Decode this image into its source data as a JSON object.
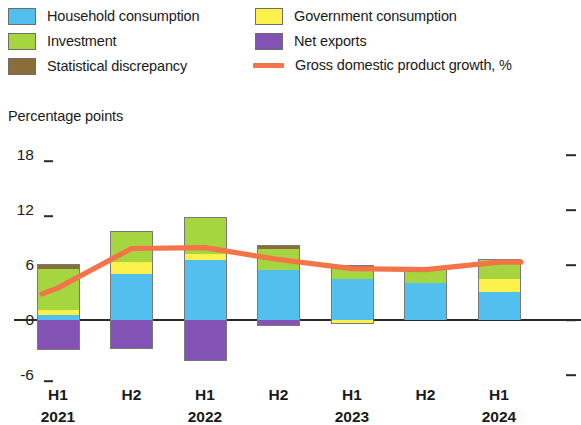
{
  "legend": {
    "items": [
      {
        "label": "Household consumption",
        "color": "#52c0ef",
        "kind": "swatch",
        "icon": "legend-swatch-household-consumption"
      },
      {
        "label": "Investment",
        "color": "#a6d63f",
        "kind": "swatch",
        "icon": "legend-swatch-investment"
      },
      {
        "label": "Statistical discrepancy",
        "color": "#8a6d3b",
        "kind": "swatch",
        "icon": "legend-swatch-statistical-discrepancy"
      },
      {
        "label": "Government consumption",
        "color": "#fbf14a",
        "kind": "swatch",
        "icon": "legend-swatch-government-consumption"
      },
      {
        "label": "Net exports",
        "color": "#8253b5",
        "kind": "swatch",
        "icon": "legend-swatch-net-exports"
      },
      {
        "label": "Gross domestic product growth, %",
        "color": "#f4744a",
        "kind": "line",
        "icon": "legend-line-gdp-growth"
      }
    ]
  },
  "axis": {
    "y_title": "Percentage points",
    "y_ticks": [
      "18",
      "12",
      "6",
      "0",
      "-6"
    ],
    "x_periods": [
      "H1",
      "H2",
      "H1",
      "H2",
      "H1",
      "H2",
      "H1"
    ],
    "x_years": [
      "2021",
      "2022",
      "2023",
      "2024"
    ]
  },
  "chart_data": {
    "type": "bar",
    "subtype": "stacked-bar-with-line-overlay",
    "title": "",
    "xlabel": "",
    "ylabel": "Percentage points",
    "ylim": [
      -8,
      18
    ],
    "yticks": [
      -6,
      0,
      6,
      12,
      18
    ],
    "grid": false,
    "legend_position": "top",
    "stacked": true,
    "categories": [
      "H1 2021",
      "H2 2021",
      "H1 2022",
      "H2 2022",
      "H1 2023",
      "H2 2023",
      "H1 2024"
    ],
    "series": [
      {
        "name": "Household consumption",
        "color": "#52c0ef",
        "values": [
          0.5,
          5.0,
          6.5,
          5.5,
          4.5,
          4.0,
          3.0
        ]
      },
      {
        "name": "Investment",
        "color": "#a6d63f",
        "values": [
          4.5,
          3.4,
          4.0,
          2.2,
          1.3,
          1.6,
          2.0
        ]
      },
      {
        "name": "Government consumption",
        "color": "#fbf14a",
        "values": [
          0.6,
          1.3,
          0.7,
          0.0,
          -0.4,
          0.0,
          1.5
        ]
      },
      {
        "name": "Net exports",
        "color": "#8253b5",
        "values": [
          -3.3,
          -3.0,
          -4.5,
          -0.6,
          0.0,
          0.0,
          0.0
        ]
      },
      {
        "name": "Statistical discrepancy",
        "color": "#8a6d3b",
        "values": [
          0.5,
          -0.2,
          0.0,
          0.5,
          0.2,
          0.0,
          0.2
        ]
      }
    ],
    "line_series": {
      "name": "Gross domestic product growth, %",
      "color": "#f4744a",
      "values": [
        3.5,
        7.8,
        7.9,
        6.6,
        5.6,
        5.5,
        6.3
      ]
    }
  }
}
